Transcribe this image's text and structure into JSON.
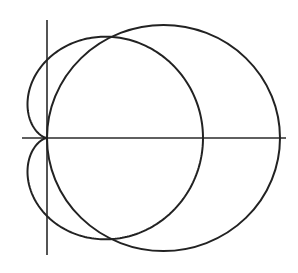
{
  "figure": {
    "background": "#ffffff",
    "stroke_color": "#222222"
  },
  "axes": {
    "origin_px": [
      47,
      138
    ],
    "x_axis": {
      "from_px": 22,
      "to_px": 286
    },
    "y_axis": {
      "from_px": 20,
      "to_px": 255
    },
    "tick_labels": []
  },
  "curves": [
    {
      "name": "cardioid",
      "equation": "r = a(1 + cos θ)",
      "a_px": 78,
      "scale_y": 1.0
    },
    {
      "name": "circle",
      "equation": "r = 2b cos θ",
      "center_px": [
        163.5,
        138
      ],
      "rx_px": 116.5,
      "ry_px": 113
    }
  ]
}
